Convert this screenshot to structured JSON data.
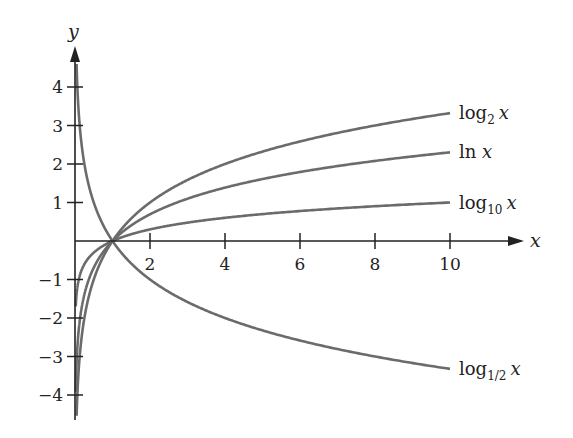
{
  "chart_data": {
    "type": "line",
    "title": "",
    "xlabel": "x",
    "ylabel": "y",
    "xlim": [
      0,
      11.5
    ],
    "ylim": [
      -4.5,
      4.6
    ],
    "grid": false,
    "legend_position": "inline-right",
    "x_ticks": [
      2,
      4,
      6,
      8,
      10
    ],
    "x_tick_labels": [
      "2",
      "4",
      "6",
      "8",
      "10"
    ],
    "y_ticks": [
      -4,
      -3,
      -2,
      -1,
      1,
      2,
      3,
      4
    ],
    "y_tick_labels": [
      "−4",
      "−3",
      "−2",
      "−1",
      "1",
      "2",
      "3",
      "4"
    ],
    "x_range_plotted": [
      0.06,
      10
    ],
    "series": [
      {
        "name": "log₂ x",
        "base": 2,
        "label_main": "log",
        "label_sub": "2",
        "label_var": "x",
        "value_at_10": 3.32
      },
      {
        "name": "ln x",
        "base": 2.718281828,
        "label_main": "ln ",
        "label_sub": "",
        "label_var": "x",
        "value_at_10": 2.3
      },
      {
        "name": "log₁₀ x",
        "base": 10,
        "label_main": "log",
        "label_sub": "10",
        "label_var": "x",
        "value_at_10": 1.0
      },
      {
        "name": "log₁/₂ x",
        "base": 0.5,
        "label_main": "log",
        "label_sub": "1/2",
        "label_var": "x",
        "value_at_10": -3.32
      }
    ],
    "colors": {
      "curve": "#6b6b6b",
      "axis": "#222222",
      "background": "#ffffff"
    }
  }
}
